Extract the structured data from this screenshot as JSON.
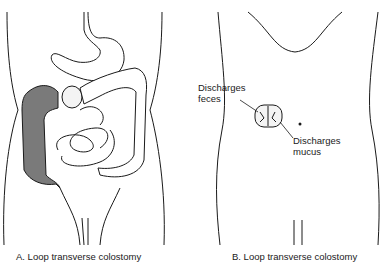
{
  "panels": [
    {
      "id": "A",
      "caption": "A.  Loop transverse colostomy"
    },
    {
      "id": "B",
      "caption": "B.  Loop transverse colostomy",
      "labels": {
        "feces_line1": "Discharges",
        "feces_line2": "feces",
        "mucus_line1": "Discharges",
        "mucus_line2": "mucus"
      }
    }
  ],
  "colors": {
    "line": "#1a1a1a",
    "shaded_colon": "#7a7a7a",
    "stoma": "#f4f4f4"
  }
}
